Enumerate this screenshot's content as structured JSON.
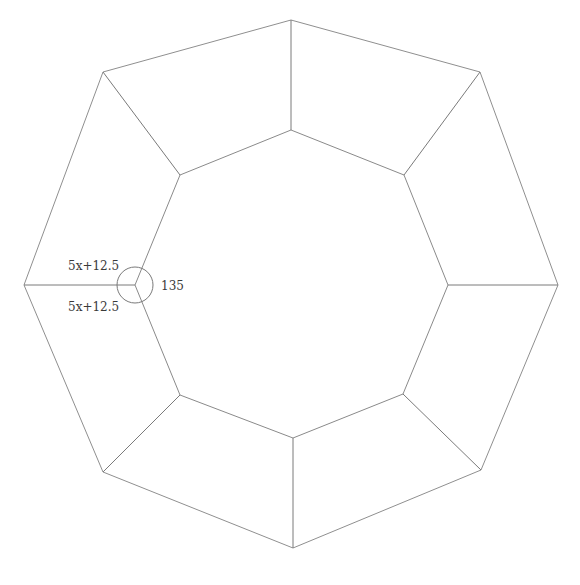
{
  "diagram": {
    "type": "octagonal frame (two concentric octagons joined by spokes)",
    "colors": {
      "line": "#8a8a8a",
      "text": "#3a3a3a",
      "background": "#ffffff"
    },
    "outer_octagon": [
      [
        291,
        20
      ],
      [
        480,
        72
      ],
      [
        558,
        285
      ],
      [
        481,
        470
      ],
      [
        293,
        548
      ],
      [
        103,
        472
      ],
      [
        24,
        285
      ],
      [
        103,
        72
      ]
    ],
    "inner_octagon": [
      [
        291,
        130
      ],
      [
        404,
        175
      ],
      [
        448,
        285
      ],
      [
        403,
        394
      ],
      [
        293,
        438
      ],
      [
        180,
        395
      ],
      [
        135,
        285
      ],
      [
        180,
        175
      ]
    ],
    "angle_marker": {
      "cx": 135,
      "cy": 285,
      "r": 18
    },
    "labels": {
      "upper_edge": "5x+12.5",
      "lower_edge": "5x+12.5",
      "angle": "135"
    }
  }
}
